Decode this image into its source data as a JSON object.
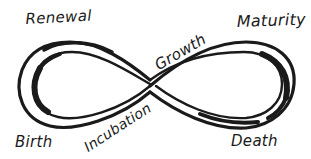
{
  "diagram": {
    "type": "infinity-loop",
    "colors": {
      "ink": "#1a1a1a",
      "background": "#ffffff"
    },
    "labels": {
      "renewal": "Renewal",
      "growth": "Growth",
      "maturity": "Maturity",
      "birth": "Birth",
      "incubation": "Incubation",
      "death": "Death"
    },
    "stages_order": [
      "Birth",
      "Incubation",
      "Growth",
      "Maturity",
      "Death",
      "Renewal"
    ]
  }
}
